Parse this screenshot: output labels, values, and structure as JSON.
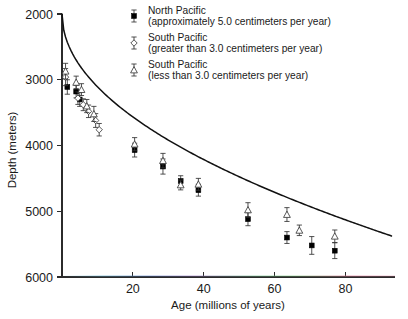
{
  "chart_data": {
    "type": "scatter",
    "title": "",
    "subtitle": "",
    "xlabel": "Age (millions of years)",
    "ylabel": "Depth (meters)",
    "xlim": [
      0,
      94
    ],
    "ylim": [
      2000,
      6000
    ],
    "y_inverted": true,
    "grid": false,
    "legend_position": "top-center",
    "xticks": [
      20,
      40,
      60,
      80
    ],
    "xtick_labels": [
      "20",
      "40",
      "60",
      "80"
    ],
    "yticks": [
      2000,
      3000,
      4000,
      5000,
      6000
    ],
    "ytick_labels": [
      "2000",
      "3000",
      "4000",
      "5000",
      "6000"
    ],
    "series": [
      {
        "name": "North Pacific",
        "note": "(approximately 5.0 centimeters per year)",
        "marker": "filled-square",
        "points": [
          {
            "x": 1.5,
            "y": 3110,
            "yerr": 110
          },
          {
            "x": 4.0,
            "y": 3180,
            "yerr": 95
          },
          {
            "x": 5.0,
            "y": 3300,
            "yerr": 105
          },
          {
            "x": 20.5,
            "y": 4070,
            "yerr": 105
          },
          {
            "x": 28.5,
            "y": 4320,
            "yerr": 115
          },
          {
            "x": 33.5,
            "y": 4540,
            "yerr": 80
          },
          {
            "x": 38.5,
            "y": 4680,
            "yerr": 90
          },
          {
            "x": 52.5,
            "y": 5120,
            "yerr": 100
          },
          {
            "x": 63.5,
            "y": 5400,
            "yerr": 90
          },
          {
            "x": 70.5,
            "y": 5520,
            "yerr": 135
          },
          {
            "x": 77.0,
            "y": 5600,
            "yerr": 120
          }
        ]
      },
      {
        "name": "South Pacific",
        "note": "(greater than 3.0 centimeters per year)",
        "marker": "open-diamond",
        "points": [
          {
            "x": 1.0,
            "y": 2960,
            "yerr": 130
          },
          {
            "x": 4.5,
            "y": 3280,
            "yerr": 95
          },
          {
            "x": 6.0,
            "y": 3380,
            "yerr": 90
          },
          {
            "x": 7.5,
            "y": 3480,
            "yerr": 95
          },
          {
            "x": 9.5,
            "y": 3620,
            "yerr": 105
          },
          {
            "x": 10.5,
            "y": 3760,
            "yerr": 95
          }
        ]
      },
      {
        "name": "South Pacific",
        "note": "(less than 3.0 centimeters per year)",
        "marker": "open-triangle",
        "points": [
          {
            "x": 1.0,
            "y": 2870,
            "yerr": 120
          },
          {
            "x": 4.0,
            "y": 3040,
            "yerr": 95
          },
          {
            "x": 5.5,
            "y": 3150,
            "yerr": 90
          },
          {
            "x": 7.0,
            "y": 3400,
            "yerr": 100
          },
          {
            "x": 9.0,
            "y": 3520,
            "yerr": 115
          },
          {
            "x": 20.5,
            "y": 3980,
            "yerr": 100
          },
          {
            "x": 28.5,
            "y": 4230,
            "yerr": 110
          },
          {
            "x": 33.5,
            "y": 4600,
            "yerr": 75
          },
          {
            "x": 38.5,
            "y": 4590,
            "yerr": 90
          },
          {
            "x": 52.5,
            "y": 4980,
            "yerr": 110
          },
          {
            "x": 63.5,
            "y": 5050,
            "yerr": 105
          },
          {
            "x": 67.0,
            "y": 5290,
            "yerr": 80
          },
          {
            "x": 77.0,
            "y": 5380,
            "yerr": 95
          }
        ]
      }
    ],
    "fit_curve": {
      "name": "theoretical-subsidence-curve",
      "equation": "depth = 2000 + 350 * sqrt(age)",
      "x_start": 0,
      "x_end": 93,
      "y_start": 2000,
      "y_end": 5680
    }
  },
  "legend": {
    "entries": [
      {
        "marker": "filled-square",
        "line1": "North Pacific",
        "line2": "(approximately 5.0 centimeters per year)"
      },
      {
        "marker": "open-diamond",
        "line1": "South Pacific",
        "line2": "(greater than 3.0 centimeters per year)"
      },
      {
        "marker": "open-triangle",
        "line1": "South Pacific",
        "line2": "(less than 3.0 centimeters per year)"
      }
    ]
  },
  "axes": {
    "x_title": "Age (millions of years)",
    "y_title": "Depth (meters)"
  }
}
